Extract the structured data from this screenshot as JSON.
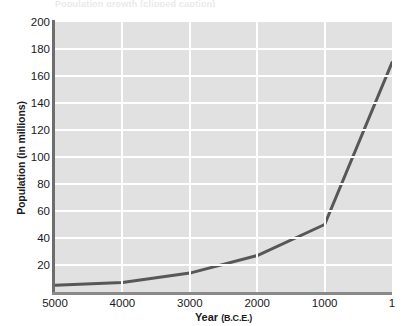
{
  "figure": {
    "top_remnant_text": "Population growth (clipped caption)"
  },
  "axes": {
    "ylabel": "Population (in millions)",
    "xlabel_main": "Year",
    "xlabel_unit": "(B.C.E.)",
    "yticks": [
      "200",
      "180",
      "160",
      "140",
      "120",
      "100",
      "80",
      "60",
      "40",
      "20"
    ],
    "xticks": [
      "5000",
      "4000",
      "3000",
      "2000",
      "1000",
      "1"
    ]
  },
  "style": {
    "plot_background": "#e1e1e1",
    "gridline_color": "#ffffff",
    "axis_color": "#6e6e6e",
    "line_color": "#575757",
    "text_color": "#1a1a1a"
  },
  "chart_data": {
    "type": "line",
    "title": "",
    "xlabel": "Year (B.C.E.)",
    "ylabel": "Population (in millions)",
    "x": [
      5000,
      4000,
      3000,
      2000,
      1000,
      1
    ],
    "values": [
      5,
      7,
      14,
      27,
      50,
      170
    ],
    "series": [
      {
        "name": "World population",
        "values": [
          5,
          7,
          14,
          27,
          50,
          170
        ]
      }
    ],
    "categories": [
      "5000",
      "4000",
      "3000",
      "2000",
      "1000",
      "1"
    ],
    "xlim": [
      5000,
      1
    ],
    "ylim": [
      0,
      200
    ],
    "x_axis_reversed": true,
    "ytick_values": [
      20,
      40,
      60,
      80,
      100,
      120,
      140,
      160,
      180,
      200
    ],
    "xtick_values": [
      5000,
      4000,
      3000,
      2000,
      1000,
      1
    ],
    "grid": true,
    "legend": false,
    "line_color": "#575757",
    "line_width": 3
  }
}
